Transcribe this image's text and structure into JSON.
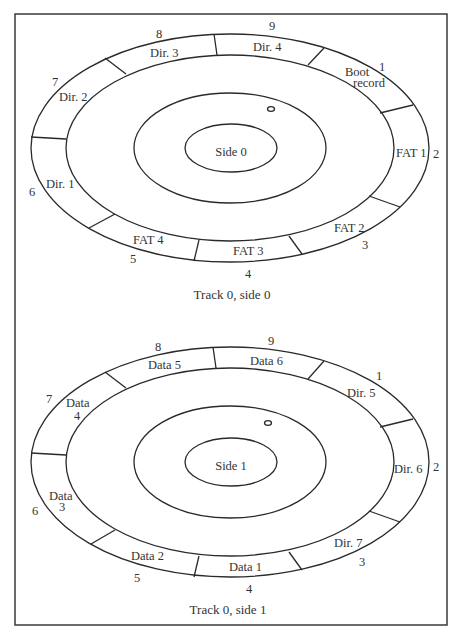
{
  "diagrams": [
    {
      "caption": "Track 0, side 0",
      "center_label": "Side 0",
      "sectors": [
        {
          "number": "1",
          "label_lines": [
            "Boot",
            "record"
          ]
        },
        {
          "number": "2",
          "label_lines": [
            "FAT 1"
          ]
        },
        {
          "number": "3",
          "label_lines": [
            "FAT 2"
          ]
        },
        {
          "number": "4",
          "label_lines": [
            "FAT 3"
          ]
        },
        {
          "number": "5",
          "label_lines": [
            "FAT 4"
          ]
        },
        {
          "number": "6",
          "label_lines": [
            "Dir. 1"
          ]
        },
        {
          "number": "7",
          "label_lines": [
            "Dir. 2"
          ]
        },
        {
          "number": "8",
          "label_lines": [
            "Dir. 3"
          ]
        },
        {
          "number": "9",
          "label_lines": [
            "Dir. 4"
          ]
        }
      ]
    },
    {
      "caption": "Track 0, side 1",
      "center_label": "Side 1",
      "sectors": [
        {
          "number": "1",
          "label_lines": [
            "Dir. 5"
          ]
        },
        {
          "number": "2",
          "label_lines": [
            "Dir. 6"
          ]
        },
        {
          "number": "3",
          "label_lines": [
            "Dir. 7"
          ]
        },
        {
          "number": "4",
          "label_lines": [
            "Data 1"
          ]
        },
        {
          "number": "5",
          "label_lines": [
            "Data 2"
          ]
        },
        {
          "number": "6",
          "label_lines": [
            "Data",
            "3"
          ]
        },
        {
          "number": "7",
          "label_lines": [
            "Data",
            "4"
          ]
        },
        {
          "number": "8",
          "label_lines": [
            "Data 5"
          ]
        },
        {
          "number": "9",
          "label_lines": [
            "Data 6"
          ]
        }
      ]
    }
  ]
}
